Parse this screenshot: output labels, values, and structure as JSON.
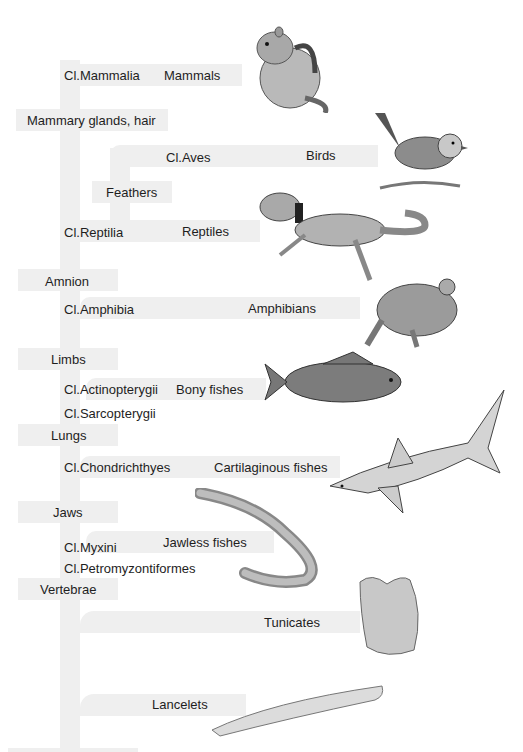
{
  "diagram": {
    "type": "cladogram",
    "trunk_color": "#efefef",
    "clades": [
      {
        "class": "Cl.Mammalia",
        "common": "Mammals",
        "animal": "chipmunk"
      },
      {
        "class": "Cl.Aves",
        "common": "Birds",
        "animal": "bird"
      },
      {
        "class": "Cl.Reptilia",
        "common": "Reptiles",
        "animal": "lizard"
      },
      {
        "class": "Cl.Amphibia",
        "common": "Amphibians",
        "animal": "frog"
      },
      {
        "class": "Cl.Actinopterygii",
        "common": "Bony fishes",
        "animal": "carp"
      },
      {
        "class": "Cl.Sarcopterygii",
        "common": ""
      },
      {
        "class": "Cl.Chondrichthyes",
        "common": "Cartilaginous fishes",
        "animal": "shark"
      },
      {
        "class": "Cl.Myxini",
        "common": "Jawless fishes",
        "animal": "lamprey"
      },
      {
        "class": "Cl.Petromyzontiformes",
        "common": ""
      },
      {
        "class": "",
        "common": "Tunicates",
        "animal": "tunicate"
      },
      {
        "class": "",
        "common": "Lancelets",
        "animal": "lancelet"
      }
    ],
    "traits": [
      "Mammary glands, hair",
      "Feathers",
      "Amnion",
      "Limbs",
      "Lungs",
      "Jaws",
      "Vertebrae"
    ]
  }
}
